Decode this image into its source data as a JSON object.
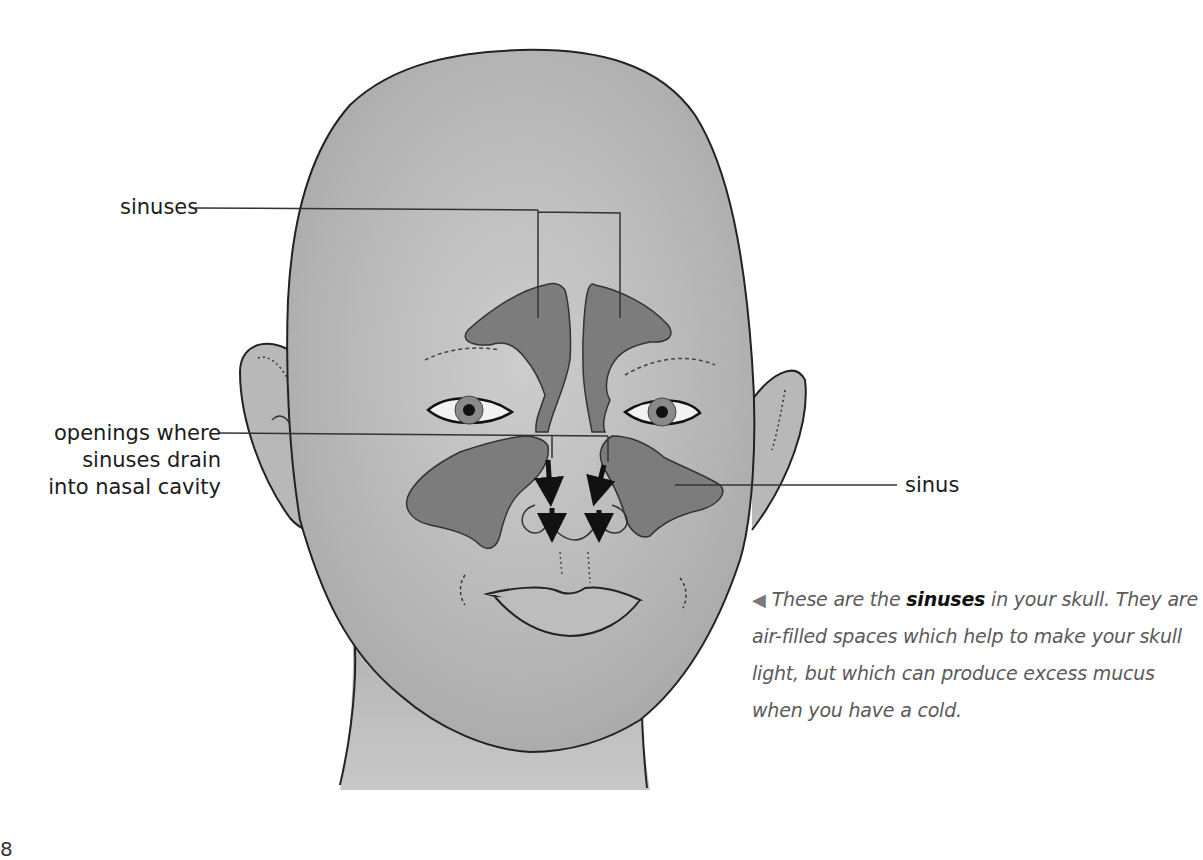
{
  "figure": {
    "labels": {
      "sinuses_top": "sinuses",
      "openings_line1": "openings where",
      "openings_line2": "sinuses drain",
      "openings_line3": "into nasal cavity",
      "sinus_right": "sinus"
    },
    "colors": {
      "skin": "#b8b8b8",
      "sinus_fill": "#7a7a7a",
      "outline": "#222222",
      "leader_line": "#333333"
    }
  },
  "caption": {
    "arrow_icon": "◀",
    "text_before": "These are the ",
    "bold_term": "sinuses",
    "text_after": " in your skull. They are air-filled spaces which help to make your skull light, but which can produce excess mucus when you have a cold."
  },
  "page": {
    "number": "8"
  }
}
